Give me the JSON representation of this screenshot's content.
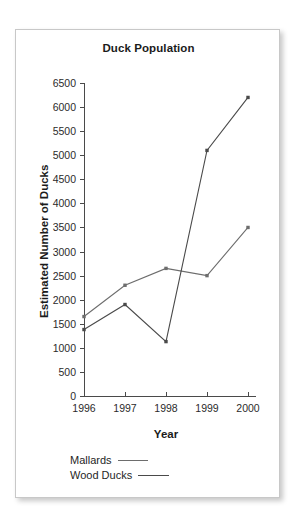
{
  "chart_data": {
    "type": "line",
    "title": "Duck Population",
    "xlabel": "Year",
    "ylabel": "Estimated Number of Ducks",
    "categories": [
      "1996",
      "1997",
      "1998",
      "1999",
      "2000"
    ],
    "x": [
      1996,
      1997,
      1998,
      1999,
      2000
    ],
    "xlim": [
      1996,
      2000
    ],
    "ylim": [
      0,
      6500
    ],
    "yticks": [
      0,
      500,
      1000,
      1500,
      2000,
      2500,
      3000,
      3500,
      4000,
      4500,
      5000,
      5500,
      6000,
      6500
    ],
    "ytick_labels": [
      "0",
      "500",
      "1000",
      "1500",
      "2000",
      "2500",
      "3000",
      "3500",
      "4000",
      "4500",
      "5000",
      "5500",
      "6000",
      "6500"
    ],
    "ytick_step": 500,
    "grid": false,
    "legend_position": "below-axis-left",
    "markers": "small-filled-square",
    "series": [
      {
        "name": "Mallards",
        "values": [
          1650,
          2300,
          2650,
          2500,
          3500
        ],
        "color": "#6d6d6d"
      },
      {
        "name": "Wood Ducks",
        "values": [
          1380,
          1900,
          1130,
          5100,
          6200
        ],
        "color": "#4a4a4a"
      }
    ]
  },
  "legend": {
    "items": [
      {
        "label": "Mallards"
      },
      {
        "label": "Wood Ducks"
      }
    ]
  },
  "colors": {
    "card_background": "#ffffff",
    "card_border": "#c8c8c8",
    "axis": "#4a4a4a",
    "text": "#1b1b1b",
    "series_mallards": "#6d6d6d",
    "series_wood_ducks": "#4a4a4a"
  }
}
